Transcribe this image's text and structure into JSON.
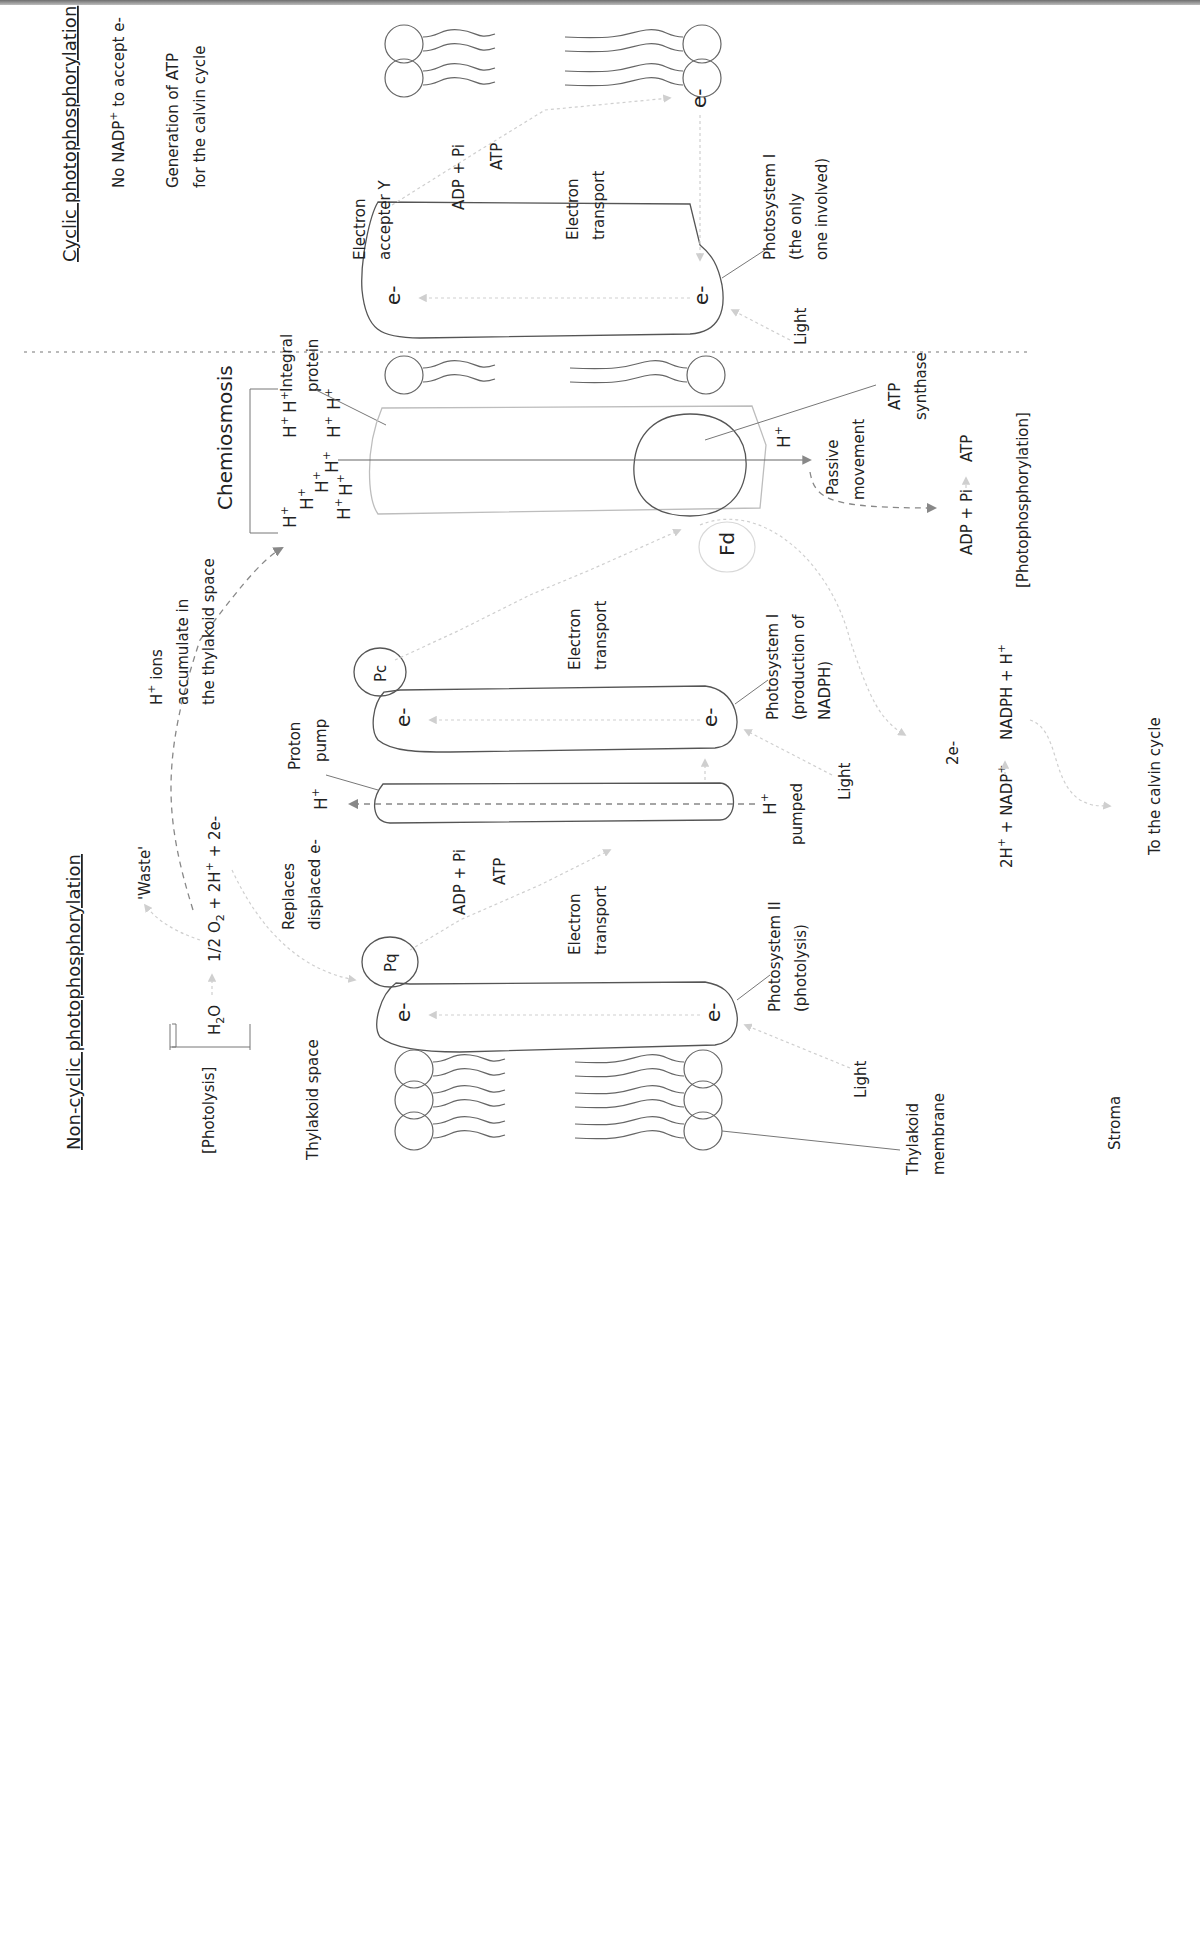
{
  "orientation": "rotated-90-ccw",
  "sections": {
    "cyclic": {
      "title": "Cyclic photophosphorylation",
      "notes": [
        "No NADP",
        "+",
        " to accept e-"
      ],
      "note2_line1": "Generation of ATP",
      "note2_line2": "for the calvin cycle",
      "electron_acceptor_line1": "Electron",
      "electron_acceptor_line2": "accepter Y",
      "adp_pi": "ADP + Pi",
      "atp": "ATP",
      "electron_transport_line1": "Electron",
      "electron_transport_line2": "transport",
      "electron": "e-",
      "photosystem_line1": "Photosystem I",
      "photosystem_line2": "(the only",
      "photosystem_line3": "one involved)",
      "light": "Light"
    },
    "chemiosmosis": {
      "title": "Chemiosmosis",
      "h_ion": "H",
      "plus": "+",
      "integral_protein_line1": "Integral",
      "integral_protein_line2": "protein",
      "atp_synthase_line1": "ATP",
      "atp_synthase_line2": "synthase",
      "passive_line1": "Passive",
      "passive_line2": "movement",
      "adp_pi": "ADP + Pi",
      "atp": "ATP",
      "photophosphorylation": "[Photophosphorylation]",
      "fd": "Fd"
    },
    "noncyclic": {
      "title": "Non-cyclic photophosphorylation",
      "photolysis": "[Photolysis]",
      "h2o": "H",
      "h2o_sub": "2",
      "h2o_o": "O",
      "half_o2": "1/2 O",
      "o2_sub": "2",
      "products": " + 2H",
      "products_sup": "+",
      "products_tail": " + 2e-",
      "waste": "'Waste'",
      "h_ions_line1": "H",
      "h_ions_line1_sup": "+",
      "h_ions_line1_tail": " ions",
      "h_ions_line2": "accumulate in",
      "h_ions_line3": "the thylakoid space",
      "replaces_line1": "Replaces",
      "replaces_line2": "displaced e-",
      "proton_pump_line1": "Proton",
      "proton_pump_line2": "pump",
      "h_plus": "H",
      "plus": "+",
      "h_pumped": "pumped",
      "pc": "Pc",
      "pq": "Pq",
      "electron": "e-",
      "adp_pi": "ADP + Pi",
      "atp": "ATP",
      "electron_transport_line1": "Electron",
      "electron_transport_line2": "transport",
      "psi_line1": "Photosystem I",
      "psi_line2": "(production of",
      "psi_line3": "NADPH)",
      "psii_line1": "Photosystem II",
      "psii_line2": "(photolysis)",
      "light": "Light",
      "two_e": "2e-",
      "nadp_reactant": "2H",
      "nadp_reactant_tail": " + NADP",
      "nadph_product": "NADPH + H",
      "to_calvin": "To the calvin cycle",
      "thylakoid_space": "Thylakoid space",
      "thylakoid_membrane_line1": "Thylakoid",
      "thylakoid_membrane_line2": "membrane",
      "stroma": "Stroma"
    }
  },
  "colors": {
    "ink": "#222222",
    "outline": "#555555",
    "light_outline": "#bdbdbd",
    "faint_arrow": "#cfcfcf",
    "dashed_arrow": "#888888"
  }
}
